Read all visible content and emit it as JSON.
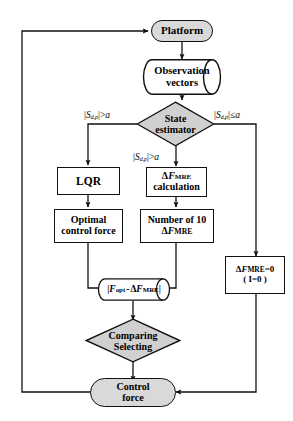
{
  "diagram": {
    "type": "flowchart",
    "colors": {
      "terminal_fill": "#d9d9d9",
      "decision_fill": "#d9d9d9",
      "process_fill": "#ffffff",
      "stroke": "#111111",
      "background": "#ffffff"
    },
    "nodes": {
      "platform": {
        "label": "Platform",
        "shape": "terminal"
      },
      "observation": {
        "line1": "Observation",
        "line2": "vectors",
        "shape": "cylinder"
      },
      "state_estimator": {
        "line1": "State",
        "line2": "estimator",
        "shape": "decision"
      },
      "lqr": {
        "label": "LQR",
        "shape": "process"
      },
      "optimal_force": {
        "line1": "Optimal",
        "line2": "control force",
        "shape": "process"
      },
      "df_calc": {
        "line1_pre": "Δ",
        "line1_var": "F",
        "line1_sub": "MRE",
        "line2": "calculation",
        "shape": "process"
      },
      "number_of_10": {
        "line1": "Number of 10",
        "line2_pre": "Δ",
        "line2_var": "F",
        "line2_sub": "MRE",
        "shape": "process"
      },
      "difference": {
        "open": "|",
        "f": "F",
        "fsub": "opt",
        "minus": "-",
        "delta": "Δ",
        "fm": "F",
        "fmsub": "MRE",
        "close": "|",
        "shape": "cylinder"
      },
      "df_zero": {
        "line1_pre": "Δ",
        "line1_var": "F",
        "line1_sub": "MRE",
        "line1_post": "=0",
        "line2": "( I=0 )",
        "shape": "process"
      },
      "comparing": {
        "line1": "Comparing",
        "line2": "Selecting",
        "shape": "decision"
      },
      "control_force": {
        "line1": "Control",
        "line2": "force",
        "shape": "terminal"
      }
    },
    "edge_labels": {
      "left_branch": {
        "open": "|",
        "var": "S",
        "sub": "d,p",
        "close": "|",
        "op": ">",
        "value": "a"
      },
      "right_branch": {
        "open": "|",
        "var": "S",
        "sub": "d,p",
        "close": "|",
        "op": "≤",
        "value": "a"
      },
      "middle_branch": {
        "open": "|",
        "var": "S",
        "sub": "d,p",
        "close": "|",
        "op": ">",
        "value": "a"
      }
    }
  }
}
